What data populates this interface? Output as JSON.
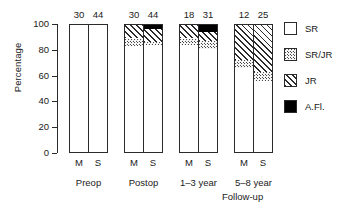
{
  "chart_data": {
    "type": "bar",
    "subtype": "stacked-percentage",
    "title": "",
    "xlabel": "Follow-up",
    "ylabel": "Percentage",
    "ylim": [
      0,
      100
    ],
    "yticks": [
      "0",
      "20",
      "40",
      "60",
      "80",
      "100"
    ],
    "grid": false,
    "legend_position": "right",
    "stack_order_bottom_to_top": [
      "SR",
      "SR/JR",
      "JR",
      "A.Fl."
    ],
    "groups": [
      "Preop",
      "Postop",
      "1–3 year",
      "5–8 year"
    ],
    "bar_labels": [
      "M",
      "S"
    ],
    "categories": [
      "Preop M",
      "Preop S",
      "Postop M",
      "Postop S",
      "1–3 year M",
      "1–3 year S",
      "5–8 year M",
      "5–8 year S"
    ],
    "n_values": [
      30,
      44,
      30,
      44,
      18,
      31,
      12,
      25
    ],
    "series": [
      {
        "name": "SR",
        "values": [
          100,
          100,
          82,
          83,
          83,
          80,
          65,
          55
        ]
      },
      {
        "name": "SR/JR",
        "values": [
          0,
          0,
          6,
          2,
          5,
          6,
          6,
          7
        ]
      },
      {
        "name": "JR",
        "values": [
          0,
          0,
          12,
          10,
          12,
          7,
          29,
          38
        ]
      },
      {
        "name": "A.Fl.",
        "values": [
          0,
          0,
          0,
          5,
          0,
          7,
          0,
          0
        ]
      }
    ]
  },
  "axes": {
    "y_title": "Percentage",
    "y_ticks": [
      {
        "label": "100",
        "value": 100
      },
      {
        "label": "80",
        "value": 80
      },
      {
        "label": "60",
        "value": 60
      },
      {
        "label": "40",
        "value": 40
      },
      {
        "label": "20",
        "value": 20
      },
      {
        "label": "0",
        "value": 0
      }
    ],
    "x_title": "Follow-up"
  },
  "groups": [
    {
      "label": "Preop",
      "bars": [
        {
          "label": "M",
          "n": "30",
          "segments": [
            {
              "key": "sr",
              "value": 100
            }
          ]
        },
        {
          "label": "S",
          "n": "44",
          "segments": [
            {
              "key": "sr",
              "value": 100
            }
          ]
        }
      ]
    },
    {
      "label": "Postop",
      "bars": [
        {
          "label": "M",
          "n": "30",
          "segments": [
            {
              "key": "sr",
              "value": 82
            },
            {
              "key": "srjr",
              "value": 6
            },
            {
              "key": "jr",
              "value": 12
            }
          ]
        },
        {
          "label": "S",
          "n": "44",
          "segments": [
            {
              "key": "sr",
              "value": 83
            },
            {
              "key": "srjr",
              "value": 2
            },
            {
              "key": "jr",
              "value": 10
            },
            {
              "key": "afl",
              "value": 5
            }
          ]
        }
      ]
    },
    {
      "label": "1–3 year",
      "bars": [
        {
          "label": "M",
          "n": "18",
          "segments": [
            {
              "key": "sr",
              "value": 83
            },
            {
              "key": "srjr",
              "value": 5
            },
            {
              "key": "jr",
              "value": 12
            }
          ]
        },
        {
          "label": "S",
          "n": "31",
          "segments": [
            {
              "key": "sr",
              "value": 80
            },
            {
              "key": "srjr",
              "value": 6
            },
            {
              "key": "jr",
              "value": 7
            },
            {
              "key": "afl",
              "value": 7
            }
          ]
        }
      ]
    },
    {
      "label": "5–8 year",
      "bars": [
        {
          "label": "M",
          "n": "12",
          "segments": [
            {
              "key": "sr",
              "value": 65
            },
            {
              "key": "srjr",
              "value": 6
            },
            {
              "key": "jr",
              "value": 29
            }
          ]
        },
        {
          "label": "S",
          "n": "25",
          "segments": [
            {
              "key": "sr",
              "value": 55
            },
            {
              "key": "srjr",
              "value": 7
            },
            {
              "key": "jr",
              "value": 38
            }
          ]
        }
      ]
    }
  ],
  "legend": {
    "items": [
      {
        "key": "sr",
        "label": "SR"
      },
      {
        "key": "srjr",
        "label": "SR/JR"
      },
      {
        "key": "jr",
        "label": "JR"
      },
      {
        "key": "afl",
        "label": "A.Fl."
      }
    ]
  },
  "colors": {
    "ink": "#2b2b2b",
    "background": "#ffffff",
    "afl_fill": "#000000",
    "hatch": "#2b2b2b",
    "stipple": "#4a4a4a"
  }
}
